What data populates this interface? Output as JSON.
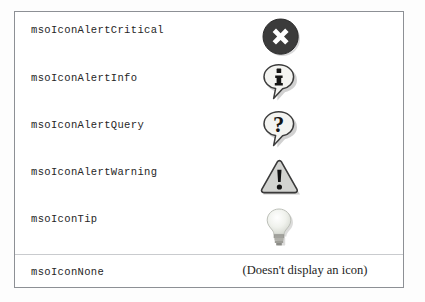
{
  "page": {
    "background_color": "#fdfdfd",
    "table_border_color": "#8d9095"
  },
  "table": {
    "name": "mso-icon-constants-table",
    "columns": [
      "Constant",
      "Icon"
    ],
    "rows": [
      {
        "label": "msoIconAlertCritical",
        "icon": "alert-critical-icon",
        "icon_description": "dark circle with white X",
        "icon_colors": {
          "fill": "#3a3a3a",
          "mark": "#ffffff"
        },
        "note": ""
      },
      {
        "label": "msoIconAlertInfo",
        "icon": "alert-info-icon",
        "icon_description": "speech balloon with letter i",
        "icon_colors": {
          "fill": "#f2f2f0",
          "stroke": "#3a3a3a",
          "mark": "#1a1a1a"
        },
        "note": ""
      },
      {
        "label": "msoIconAlertQuery",
        "icon": "alert-query-icon",
        "icon_description": "speech balloon with question mark",
        "icon_colors": {
          "fill": "#f2f2f0",
          "stroke": "#3a3a3a",
          "mark": "#1a1a1a"
        },
        "note": ""
      },
      {
        "label": "msoIconAlertWarning",
        "icon": "alert-warning-icon",
        "icon_description": "grey triangle with exclamation mark",
        "icon_colors": {
          "fill": "#cfd0cd",
          "stroke": "#3a3a3a",
          "mark": "#111111"
        },
        "note": ""
      },
      {
        "label": "msoIconTip",
        "icon": "tip-lightbulb-icon",
        "icon_description": "light bulb",
        "icon_colors": {
          "fill": "#e9ebe6",
          "stroke": "#b9bcb6",
          "base": "#9a9a96"
        },
        "note": ""
      },
      {
        "label": "msoIconNone",
        "icon": "none-icon",
        "icon_description": "no icon displayed",
        "icon_colors": {},
        "note": "(Doesn't display an icon)"
      }
    ]
  }
}
